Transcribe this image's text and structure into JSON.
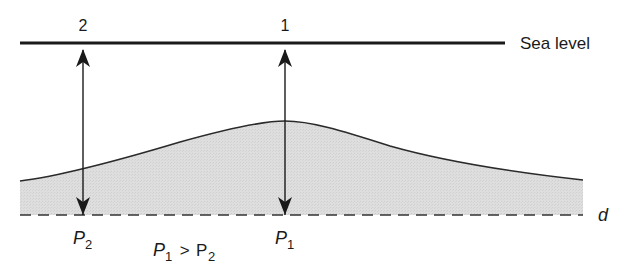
{
  "diagram": {
    "type": "geoid-undulation-pressure",
    "colors": {
      "ink": "#1a1a1a",
      "fill": "#dcdcdc",
      "background": "#ffffff"
    },
    "sea_level": {
      "label": "Sea level",
      "y": 43,
      "x_start": 20,
      "x_end": 505
    },
    "datum": {
      "label": "d",
      "y": 215,
      "x_start": 20,
      "x_end": 583,
      "style": "dashed"
    },
    "points": [
      {
        "id": "2",
        "label": "2",
        "x": 83,
        "pressure_label": "P",
        "pressure_sub": "2"
      },
      {
        "id": "1",
        "label": "1",
        "x": 285,
        "pressure_label": "P",
        "pressure_sub": "1"
      }
    ],
    "comparison": {
      "left": "P",
      "left_sub": "1",
      "op": " > ",
      "right": "P",
      "right_sub": "2"
    },
    "surface_curve": {
      "start": [
        20,
        181
      ],
      "peak": [
        285,
        121
      ],
      "end": [
        583,
        180
      ]
    }
  }
}
